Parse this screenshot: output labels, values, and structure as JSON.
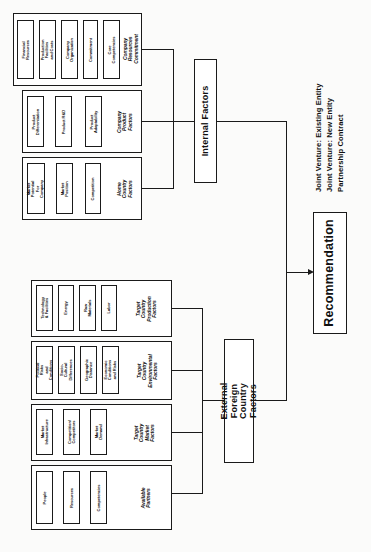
{
  "diagram": {
    "orientation": "rotated-90",
    "colors": {
      "stroke": "#1a1a1a",
      "fill": "#ffffff",
      "page": "#fbfbfa"
    }
  },
  "internal": {
    "label": "Internal Factors",
    "groups": [
      {
        "category": "Company Resources Commitment",
        "items": [
          "Financial Resources",
          "Production Facilities and Costs",
          "Company Organization",
          "Commitment",
          "Core Competencies"
        ]
      },
      {
        "category": "Company Product Factors",
        "items": [
          "Product Differentiation",
          "Product R&D",
          "Product Adaptability"
        ]
      },
      {
        "category": "Home Country Factors",
        "items": [
          "Market Potential For Company",
          "Market Position",
          "Competition"
        ]
      }
    ]
  },
  "external": {
    "label": "External Foreign Country Factors",
    "groups": [
      {
        "category": "Target Country Production Factors",
        "items": [
          "Technology & Facilities",
          "Energy",
          "Raw Materials",
          "Labor"
        ]
      },
      {
        "category": "Target Country Environmental Factors",
        "items": [
          "Political Risks and Conditions",
          "Socio-Cultural Differences",
          "Geographic Distance",
          "Economic Conditions and Risks"
        ]
      },
      {
        "category": "Target Country Market Factors",
        "items": [
          "Market Infrastructure",
          "Competition/Competitors",
          "Market Demand"
        ]
      },
      {
        "category": "Available Partners",
        "items": [
          "People",
          "Resources",
          "Competencies"
        ]
      }
    ]
  },
  "outcome": {
    "label": "Recommendation",
    "options": [
      "Joint Venture:  Existing  Entity",
      "Joint Venture:  New Entity",
      "Partnership Contract"
    ]
  }
}
